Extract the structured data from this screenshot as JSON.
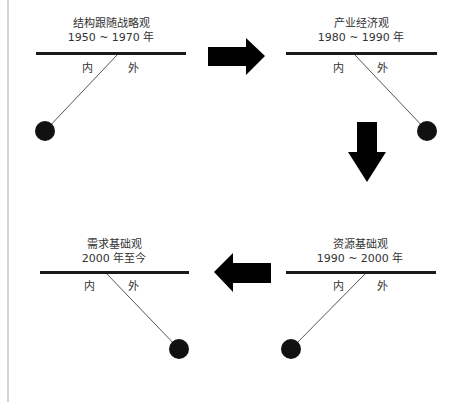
{
  "diagram": {
    "panels": [
      {
        "id": "structure-follows-strategy",
        "name": "结构跟随战略观",
        "period": "1950 ~ 1970 年",
        "inner_label": "内",
        "outer_label": "外",
        "pendulum_side": "inner",
        "bar": {
          "x1": 36,
          "x2": 186,
          "y": 52
        },
        "pivot": {
          "x": 118,
          "y": 54
        },
        "ball": {
          "cx": 45,
          "cy": 131,
          "r": 10
        },
        "title_pos": {
          "cx": 111,
          "y": 17
        },
        "labels_pos": {
          "inner_x": 82,
          "outer_x": 128,
          "y": 63
        }
      },
      {
        "id": "industrial-economics",
        "name": "产业经济观",
        "period": "1980 ~ 1990 年",
        "inner_label": "内",
        "outer_label": "外",
        "pendulum_side": "outer",
        "bar": {
          "x1": 286,
          "x2": 437,
          "y": 52
        },
        "pivot": {
          "x": 354,
          "y": 54
        },
        "ball": {
          "cx": 427,
          "cy": 131,
          "r": 10
        },
        "title_pos": {
          "cx": 361,
          "y": 17
        },
        "labels_pos": {
          "inner_x": 333,
          "outer_x": 377,
          "y": 63
        }
      },
      {
        "id": "resource-based",
        "name": "资源基础观",
        "period": "1990 ~ 2000 年",
        "inner_label": "内",
        "outer_label": "外",
        "pendulum_side": "inner",
        "bar": {
          "x1": 286,
          "x2": 436,
          "y": 271
        },
        "pivot": {
          "x": 366,
          "y": 273
        },
        "ball": {
          "cx": 291,
          "cy": 349,
          "r": 10
        },
        "title_pos": {
          "cx": 360,
          "y": 238
        },
        "labels_pos": {
          "inner_x": 333,
          "outer_x": 377,
          "y": 281
        }
      },
      {
        "id": "demand-based",
        "name": "需求基础观",
        "period": "2000 年至今",
        "inner_label": "内",
        "outer_label": "外",
        "pendulum_side": "outer",
        "bar": {
          "x1": 40,
          "x2": 189,
          "y": 271
        },
        "pivot": {
          "x": 106,
          "y": 273
        },
        "ball": {
          "cx": 179,
          "cy": 349,
          "r": 10
        },
        "title_pos": {
          "cx": 114,
          "y": 238
        },
        "labels_pos": {
          "inner_x": 84,
          "outer_x": 128,
          "y": 281
        }
      }
    ],
    "arrows": [
      {
        "id": "arrow-right",
        "direction": "right",
        "from": "structure-follows-strategy",
        "to": "industrial-economics",
        "points": "208,47 246,47 246,38 265,56 246,75 246,66 208,66"
      },
      {
        "id": "arrow-down",
        "direction": "down",
        "from": "industrial-economics",
        "to": "resource-based",
        "points": "357,122 377,122 377,152 386,152 367,182 348,152 357,152"
      },
      {
        "id": "arrow-left",
        "direction": "left",
        "from": "resource-based",
        "to": "demand-based",
        "points": "271,263 271,283 233,283 233,292 214,272 233,253 233,263"
      }
    ],
    "colors": {
      "bar": "#1a1a1a",
      "ball": "#111111",
      "string": "#555555",
      "arrow": "#000000",
      "text": "#333333",
      "edge_line": "#d4d4d4"
    }
  }
}
